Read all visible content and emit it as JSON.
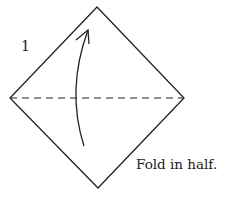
{
  "diagram": {
    "step_number": "1",
    "caption": "Fold in half.",
    "colors": {
      "line": "#222222",
      "background": "#ffffff"
    },
    "shapes": {
      "paper": "diamond-square",
      "fold_line": "dashed-horizontal-diagonal",
      "arrow": "curved-arrow-up"
    }
  }
}
